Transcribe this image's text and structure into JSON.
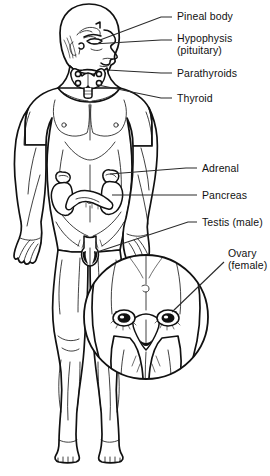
{
  "figure": {
    "background_color": "#ffffff",
    "ink_color": "#111111",
    "leader_color": "#2a2a2a",
    "width": 270,
    "height": 476
  },
  "labels": [
    {
      "id": "pineal-body",
      "line1": "Pineal body",
      "line2": "",
      "text_x": 177,
      "text_y": 11,
      "leader": "M 172 17 L 161 17 L 100 40",
      "target_organ": "pineal gland in brain"
    },
    {
      "id": "hypophysis",
      "line1": "Hypophysis",
      "line2": "(pituitary)",
      "text_x": 177,
      "text_y": 33,
      "leader": "M 172 40 L 161 40 L 93 44",
      "target_organ": "pituitary gland at base of brain"
    },
    {
      "id": "parathyroids",
      "line1": "Parathyroids",
      "line2": "",
      "text_x": 177,
      "text_y": 68,
      "leader": "M 172 73 L 161 73 L 107 70",
      "target_organ": "parathyroid glands on thyroid"
    },
    {
      "id": "thyroid",
      "line1": "Thyroid",
      "line2": "",
      "text_x": 177,
      "text_y": 93,
      "leader": "M 172 98 L 161 98 L 98 85",
      "target_organ": "thyroid gland in neck"
    },
    {
      "id": "adrenal",
      "line1": "Adrenal",
      "line2": "",
      "text_x": 202,
      "text_y": 163,
      "leader": "M 197 168 L 186 168 L 110 174",
      "target_organ": "adrenal gland atop kidney"
    },
    {
      "id": "pancreas",
      "line1": "Pancreas",
      "line2": "",
      "text_x": 202,
      "text_y": 190,
      "leader": "M 197 195 L 186 195 L 112 195",
      "target_organ": "pancreas in abdomen"
    },
    {
      "id": "testis-male",
      "line1": "Testis (male)",
      "line2": "",
      "text_x": 202,
      "text_y": 217,
      "leader": "M 197 222 L 188 222 L 94 253",
      "target_organ": "testis in scrotum"
    },
    {
      "id": "ovary-female",
      "line1": "Ovary",
      "line2": "(female)",
      "text_x": 228,
      "text_y": 248,
      "leader": "M 224 262 L 172 312",
      "target_organ": "ovary in female pelvis inset"
    }
  ],
  "inset": {
    "id": "female-pelvis-inset",
    "shape": "circle",
    "center_x": 146,
    "center_y": 317,
    "radius": 62,
    "description": "magnified female pelvis showing uterus, fallopian tubes and ovaries"
  },
  "icons": {
    "pineal": "pineal-gland-icon",
    "pituitary": "pituitary-gland-icon",
    "thyroid": "thyroid-gland-icon",
    "parathyroid": "parathyroid-gland-icon",
    "adrenal": "adrenal-gland-icon",
    "pancreas": "pancreas-icon",
    "testis": "testis-icon",
    "ovary": "ovary-icon"
  }
}
